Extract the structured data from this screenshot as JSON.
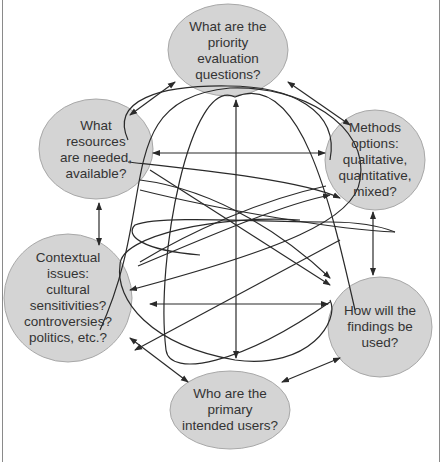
{
  "diagram": {
    "type": "interconnected-questions",
    "node_fill": "#d4d4d4",
    "node_stroke": "#a8a8a8",
    "line_color": "#2a2a2a",
    "nodes": [
      {
        "id": "priority",
        "label": "What are the\npriority\nevaluation\nquestions?"
      },
      {
        "id": "resources",
        "label": "What\nresources\nare needed,\navailable?"
      },
      {
        "id": "methods",
        "label": "Methods\noptions:\nqualitative,\nquantitative,\nmixed?"
      },
      {
        "id": "contextual",
        "label": "Contextual\nissues:\ncultural\nsensitivities?\ncontroversies?\npolitics, etc.?"
      },
      {
        "id": "findings",
        "label": "How will the\nfindings be\nused?"
      },
      {
        "id": "users",
        "label": "Who are the\nprimary\nintended users?"
      }
    ],
    "edges": [
      {
        "from": "priority",
        "to": "resources",
        "style": "double-arrow"
      },
      {
        "from": "priority",
        "to": "methods",
        "style": "double-arrow"
      },
      {
        "from": "resources",
        "to": "contextual",
        "style": "double-arrow"
      },
      {
        "from": "methods",
        "to": "findings",
        "style": "double-arrow"
      },
      {
        "from": "contextual",
        "to": "users",
        "style": "double-arrow"
      },
      {
        "from": "findings",
        "to": "users",
        "style": "double-arrow"
      },
      {
        "from": "priority",
        "to": "users",
        "style": "double-arrow-vertical"
      },
      {
        "from": "resources",
        "to": "methods",
        "style": "double-arrow-horizontal"
      },
      {
        "from": "contextual",
        "to": "findings",
        "style": "double-arrow-horizontal"
      },
      {
        "from": "various",
        "to": "various",
        "style": "looping-curves"
      }
    ]
  }
}
